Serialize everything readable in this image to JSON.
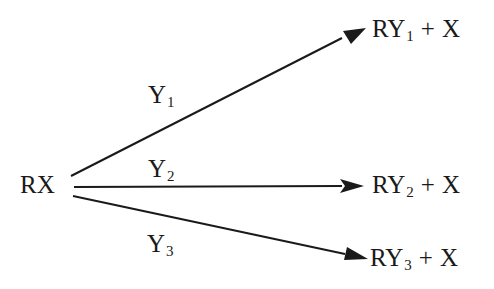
{
  "diagram": {
    "reactant": {
      "label": "RX"
    },
    "pathways": [
      {
        "reagent": {
          "base": "Y",
          "sub": "1"
        },
        "product": {
          "base": "RY",
          "sub": "1",
          "plus": "+",
          "leaving": "X"
        }
      },
      {
        "reagent": {
          "base": "Y",
          "sub": "2"
        },
        "product": {
          "base": "RY",
          "sub": "2",
          "plus": "+",
          "leaving": "X"
        }
      },
      {
        "reagent": {
          "base": "Y",
          "sub": "3"
        },
        "product": {
          "base": "RY",
          "sub": "3",
          "plus": "+",
          "leaving": "X"
        }
      }
    ],
    "colors": {
      "ink": "#1a1a1a",
      "background": "#ffffff"
    }
  }
}
